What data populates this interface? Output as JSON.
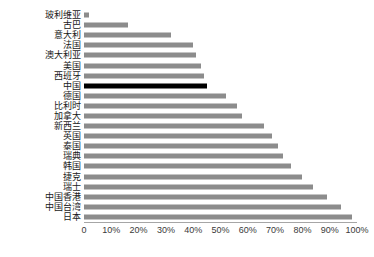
{
  "chart_data": {
    "type": "bar",
    "orientation": "horizontal",
    "title": "",
    "subtitle": "",
    "xlabel": "",
    "ylabel": "",
    "xlim": [
      0,
      100
    ],
    "grid": false,
    "legend": null,
    "categories": [
      "玻利维亚",
      "古巴",
      "意大利",
      "法国",
      "澳大利亚",
      "美国",
      "西班牙",
      "中国",
      "德国",
      "比利时",
      "加拿大",
      "新西兰",
      "英国",
      "泰国",
      "瑞典",
      "韩国",
      "捷克",
      "瑞士",
      "中国香港",
      "中国台湾",
      "日本"
    ],
    "values": [
      2,
      16,
      32,
      40,
      41,
      43,
      44,
      45,
      52,
      56,
      58,
      66,
      69,
      71,
      73,
      76,
      80,
      84,
      89,
      94,
      98
    ],
    "value_unit": "%",
    "bar_color": "#8c8c8c",
    "highlight_color": "#000000",
    "highlight_category": "中国",
    "axis_color": "#a6a6a6",
    "xticks": [
      {
        "value": 0,
        "label": "0"
      },
      {
        "value": 10,
        "label": "10%"
      },
      {
        "value": 20,
        "label": "20%"
      },
      {
        "value": 30,
        "label": "30%"
      },
      {
        "value": 40,
        "label": "40%"
      },
      {
        "value": 50,
        "label": "50%"
      },
      {
        "value": 60,
        "label": "60%"
      },
      {
        "value": 70,
        "label": "70%"
      },
      {
        "value": 80,
        "label": "80%"
      },
      {
        "value": 90,
        "label": "90%"
      },
      {
        "value": 100,
        "label": "100%"
      }
    ]
  }
}
